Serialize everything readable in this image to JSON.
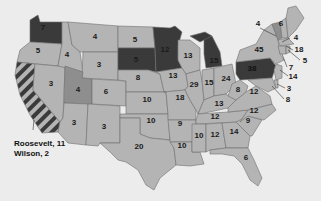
{
  "map": {
    "subject": "Electoral vote map of the United States",
    "colors": {
      "wilson": "#b4b4b4",
      "roosevelt": "#3a3a3a",
      "taft": "#8e8e8e",
      "background": "#ececec",
      "split_stripe_a": "#3a3a3a",
      "split_stripe_b": "#b4b4b4"
    },
    "states": [
      {
        "id": "WA",
        "votes": "7",
        "party": "roosevelt"
      },
      {
        "id": "OR",
        "votes": "5",
        "party": "wilson"
      },
      {
        "id": "ID",
        "votes": "4",
        "party": "wilson"
      },
      {
        "id": "MT",
        "votes": "4",
        "party": "wilson"
      },
      {
        "id": "ND",
        "votes": "5",
        "party": "wilson"
      },
      {
        "id": "SD",
        "votes": "5",
        "party": "roosevelt"
      },
      {
        "id": "MN",
        "votes": "12",
        "party": "roosevelt"
      },
      {
        "id": "WY",
        "votes": "3",
        "party": "wilson"
      },
      {
        "id": "NV",
        "votes": "3",
        "party": "wilson"
      },
      {
        "id": "UT",
        "votes": "4",
        "party": "taft"
      },
      {
        "id": "CO",
        "votes": "6",
        "party": "wilson"
      },
      {
        "id": "NE",
        "votes": "8",
        "party": "wilson"
      },
      {
        "id": "KS",
        "votes": "10",
        "party": "wilson"
      },
      {
        "id": "OK",
        "votes": "10",
        "party": "wilson"
      },
      {
        "id": "AZ",
        "votes": "3",
        "party": "wilson"
      },
      {
        "id": "NM",
        "votes": "3",
        "party": "wilson"
      },
      {
        "id": "TX",
        "votes": "20",
        "party": "wilson"
      },
      {
        "id": "IA",
        "votes": "13",
        "party": "wilson"
      },
      {
        "id": "MO",
        "votes": "18",
        "party": "wilson"
      },
      {
        "id": "AR",
        "votes": "9",
        "party": "wilson"
      },
      {
        "id": "LA",
        "votes": "10",
        "party": "wilson"
      },
      {
        "id": "WI",
        "votes": "13",
        "party": "wilson"
      },
      {
        "id": "IL",
        "votes": "29",
        "party": "wilson"
      },
      {
        "id": "MI",
        "votes": "15",
        "party": "roosevelt"
      },
      {
        "id": "IN",
        "votes": "15",
        "party": "wilson"
      },
      {
        "id": "OH",
        "votes": "24",
        "party": "wilson"
      },
      {
        "id": "KY",
        "votes": "13",
        "party": "wilson"
      },
      {
        "id": "TN",
        "votes": "12",
        "party": "wilson"
      },
      {
        "id": "MS",
        "votes": "10",
        "party": "wilson"
      },
      {
        "id": "AL",
        "votes": "12",
        "party": "wilson"
      },
      {
        "id": "GA",
        "votes": "14",
        "party": "wilson"
      },
      {
        "id": "FL",
        "votes": "6",
        "party": "wilson"
      },
      {
        "id": "SC",
        "votes": "9",
        "party": "wilson"
      },
      {
        "id": "NC",
        "votes": "12",
        "party": "wilson"
      },
      {
        "id": "VA",
        "votes": "12",
        "party": "wilson"
      },
      {
        "id": "WV",
        "votes": "8",
        "party": "wilson"
      },
      {
        "id": "PA",
        "votes": "38",
        "party": "roosevelt"
      },
      {
        "id": "NY",
        "votes": "45",
        "party": "wilson"
      },
      {
        "id": "VT",
        "votes": "4",
        "party": "taft"
      },
      {
        "id": "NH",
        "votes": "4",
        "party": "wilson"
      },
      {
        "id": "ME",
        "votes": "6",
        "party": "wilson"
      },
      {
        "id": "MA",
        "votes": "18",
        "party": "wilson"
      },
      {
        "id": "RI",
        "votes": "5",
        "party": "wilson"
      },
      {
        "id": "CT",
        "votes": "7",
        "party": "wilson"
      },
      {
        "id": "NJ",
        "votes": "14",
        "party": "wilson"
      },
      {
        "id": "DE",
        "votes": "3",
        "party": "wilson"
      },
      {
        "id": "MD",
        "votes": "8",
        "party": "wilson"
      },
      {
        "id": "CA",
        "votes": "",
        "party": "split"
      }
    ],
    "labels": {
      "WA": "7",
      "OR": "5",
      "ID": "4",
      "MT": "4",
      "ND": "5",
      "SD": "5",
      "MN": "12",
      "WY": "3",
      "NV": "3",
      "UT": "4",
      "CO": "6",
      "NE": "8",
      "KS": "10",
      "OK": "10",
      "AZ": "3",
      "NM": "3",
      "TX": "20",
      "IA": "13",
      "MO": "18",
      "AR": "9",
      "LA": "10",
      "WI": "13",
      "IL": "29",
      "MI": "15",
      "IN": "15",
      "OH": "24",
      "KY": "13",
      "TN": "12",
      "MS": "10",
      "AL": "12",
      "GA": "14",
      "FL": "6",
      "SC": "9",
      "NC": "12",
      "VA": "12",
      "WV": "8",
      "PA": "38",
      "NY": "45",
      "VT": "4",
      "NH": "4",
      "ME": "6",
      "MA": "18",
      "RI": "5",
      "CT": "7",
      "NJ": "14",
      "DE": "3",
      "MD": "8"
    },
    "california_note": {
      "line1": "Roosevelt, 11",
      "line2": "Wilson, 2"
    }
  }
}
